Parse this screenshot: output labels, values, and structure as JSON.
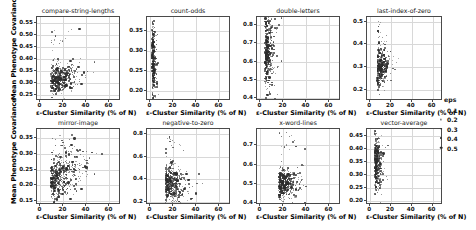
{
  "figure": {
    "shared_ylabel": "Mean Phenotype Covariance",
    "shared_xlabel": "ε-Cluster Similarity (% of N)",
    "grid": true,
    "marker_color": "#2b2b2b",
    "grid_color": "#d8d8d8",
    "axis_color": "#4a4a4a"
  },
  "legend": {
    "title": "eps",
    "position": "right-middle",
    "entries": [
      {
        "label": "0.1",
        "size": 0.9
      },
      {
        "label": "0.2",
        "size": 1.2
      },
      {
        "label": "0.3",
        "size": 1.6
      },
      {
        "label": "0.4",
        "size": 2.1
      },
      {
        "label": "0.5",
        "size": 2.6
      }
    ]
  },
  "chart_data": [
    {
      "type": "scatter",
      "title": "compare-string-lengths",
      "xlabel": "ε-Cluster Similarity (% of N)",
      "ylabel": "Mean Phenotype Covariance",
      "xlim": [
        -3,
        70
      ],
      "ylim": [
        0.225,
        0.575
      ],
      "xticks": [
        0,
        20,
        40,
        60
      ],
      "yticks": [
        0.25,
        0.3,
        0.35,
        0.4,
        0.45,
        0.5,
        0.55
      ],
      "ytick_labels": [
        "0.25",
        "0.30",
        "0.35",
        "0.40",
        "0.45",
        "0.50",
        "0.55"
      ],
      "xtick_labels": [
        "0",
        "20",
        "40",
        "60"
      ],
      "n_points": 470,
      "cloud": {
        "x_mode": 9,
        "x_spread": 11,
        "y_mode": 0.305,
        "y_spread": 0.028,
        "corr": 0.35,
        "x_max": 62,
        "y_max": 0.53
      }
    },
    {
      "type": "scatter",
      "title": "count-odds",
      "xlabel": "ε-Cluster Similarity (% of N)",
      "ylabel": "",
      "xlim": [
        -3,
        70
      ],
      "ylim": [
        0.175,
        0.385
      ],
      "xticks": [
        0,
        20,
        40,
        60
      ],
      "yticks": [
        0.2,
        0.25,
        0.3,
        0.35
      ],
      "ytick_labels": [
        "0.20",
        "0.25",
        "0.30",
        "0.35"
      ],
      "xtick_labels": [
        "0",
        "20",
        "40",
        "60"
      ],
      "n_points": 330,
      "cloud": {
        "x_mode": 1.4,
        "x_spread": 1.6,
        "y_mode": 0.272,
        "y_spread": 0.042,
        "corr": 0.05,
        "x_max": 9,
        "y_max": 0.375
      }
    },
    {
      "type": "scatter",
      "title": "double-letters",
      "xlabel": "ε-Cluster Similarity (% of N)",
      "ylabel": "",
      "xlim": [
        -3,
        70
      ],
      "ylim": [
        0.385,
        0.845
      ],
      "xticks": [
        0,
        20,
        40,
        60
      ],
      "yticks": [
        0.4,
        0.5,
        0.6,
        0.7,
        0.8
      ],
      "ytick_labels": [
        "0.4",
        "0.5",
        "0.6",
        "0.7",
        "0.8"
      ],
      "xtick_labels": [
        "0",
        "20",
        "40",
        "60"
      ],
      "n_points": 430,
      "cloud": {
        "x_mode": 4,
        "x_spread": 3.4,
        "y_mode": 0.645,
        "y_spread": 0.095,
        "corr": 0.08,
        "x_max": 30,
        "y_max": 0.83
      }
    },
    {
      "type": "scatter",
      "title": "last-index-of-zero",
      "xlabel": "ε-Cluster Similarity (% of N)",
      "ylabel": "",
      "xlim": [
        -3,
        70
      ],
      "ylim": [
        0.15,
        0.52
      ],
      "xticks": [
        0,
        20,
        40,
        60
      ],
      "yticks": [
        0.2,
        0.3,
        0.4,
        0.5
      ],
      "ytick_labels": [
        "0.2",
        "0.3",
        "0.4",
        "0.5"
      ],
      "xtick_labels": [
        "0",
        "20",
        "40",
        "60"
      ],
      "n_points": 400,
      "cloud": {
        "x_mode": 7,
        "x_spread": 4.5,
        "y_mode": 0.295,
        "y_spread": 0.042,
        "corr": 0.12,
        "x_max": 34,
        "y_max": 0.5
      }
    },
    {
      "type": "scatter",
      "title": "mirror-image",
      "xlabel": "ε-Cluster Similarity (% of N)",
      "ylabel": "Mean Phenotype Covariance",
      "xlim": [
        -3,
        70
      ],
      "ylim": [
        0.138,
        0.378
      ],
      "xticks": [
        0,
        20,
        40,
        60
      ],
      "yticks": [
        0.15,
        0.2,
        0.25,
        0.3,
        0.35
      ],
      "ytick_labels": [
        "0.15",
        "0.20",
        "0.25",
        "0.30",
        "0.35"
      ],
      "xtick_labels": [
        "0",
        "20",
        "40",
        "60"
      ],
      "n_points": 520,
      "cloud": {
        "x_mode": 9,
        "x_spread": 13,
        "y_mode": 0.215,
        "y_spread": 0.032,
        "corr": 0.62,
        "x_max": 64,
        "y_max": 0.365
      }
    },
    {
      "type": "scatter",
      "title": "negative-to-zero",
      "xlabel": "ε-Cluster Similarity (% of N)",
      "ylabel": "",
      "xlim": [
        -3,
        70
      ],
      "ylim": [
        0.17,
        0.845
      ],
      "xticks": [
        0,
        20,
        40,
        60
      ],
      "yticks": [
        0.2,
        0.4,
        0.6,
        0.8
      ],
      "ytick_labels": [
        "0.2",
        "0.4",
        "0.6",
        "0.8"
      ],
      "xtick_labels": [
        "0",
        "20",
        "40",
        "60"
      ],
      "n_points": 470,
      "cloud": {
        "x_mode": 13,
        "x_spread": 8,
        "y_mode": 0.37,
        "y_spread": 0.085,
        "corr": -0.18,
        "x_max": 48,
        "y_max": 0.81
      }
    },
    {
      "type": "scatter",
      "title": "x-word-lines",
      "xlabel": "ε-Cluster Similarity (% of N)",
      "ylabel": "",
      "xlim": [
        -3,
        70
      ],
      "ylim": [
        0.39,
        0.785
      ],
      "xticks": [
        0,
        20,
        40,
        60
      ],
      "yticks": [
        0.4,
        0.5,
        0.6,
        0.7
      ],
      "ytick_labels": [
        "0.4",
        "0.5",
        "0.6",
        "0.7"
      ],
      "xtick_labels": [
        "0",
        "20",
        "40",
        "60"
      ],
      "n_points": 470,
      "cloud": {
        "x_mode": 16,
        "x_spread": 8,
        "y_mode": 0.502,
        "y_spread": 0.038,
        "corr": 0.02,
        "x_max": 42,
        "y_max": 0.77
      }
    },
    {
      "type": "scatter",
      "title": "vector-average",
      "xlabel": "ε-Cluster Similarity (% of N)",
      "ylabel": "",
      "xlim": [
        -3,
        70
      ],
      "ylim": [
        0.185,
        0.475
      ],
      "xticks": [
        0,
        20,
        40,
        60
      ],
      "yticks": [
        0.2,
        0.25,
        0.3,
        0.35,
        0.4,
        0.45
      ],
      "ytick_labels": [
        "0.20",
        "0.25",
        "0.30",
        "0.35",
        "0.40",
        "0.45"
      ],
      "xtick_labels": [
        "0",
        "20",
        "40",
        "60"
      ],
      "n_points": 400,
      "cloud": {
        "x_mode": 4.5,
        "x_spread": 3.2,
        "y_mode": 0.335,
        "y_spread": 0.048,
        "corr": -0.15,
        "x_max": 28,
        "y_max": 0.465
      }
    }
  ]
}
